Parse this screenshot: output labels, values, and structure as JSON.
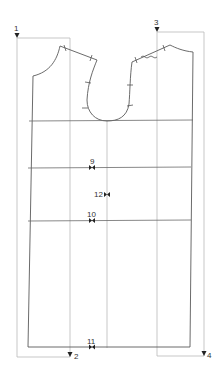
{
  "diagram": {
    "type": "sewing-pattern-bodice",
    "colors": {
      "background": "#ffffff",
      "guide": "#b9b9b9",
      "outline": "#5a5a5a",
      "marker": "#222222"
    },
    "point_labels": [
      {
        "id": "p1",
        "text": "1",
        "x": 17,
        "y": 30
      },
      {
        "id": "p2",
        "text": "2",
        "x": 71,
        "y": 357
      },
      {
        "id": "p3",
        "text": "3",
        "x": 156,
        "y": 24
      },
      {
        "id": "p4",
        "text": "4",
        "x": 205,
        "y": 357
      }
    ],
    "notch_labels": [
      {
        "id": "n9",
        "text": "9",
        "x": 92,
        "y": 134
      },
      {
        "id": "n12",
        "text": "12",
        "x": 100,
        "y": 196
      },
      {
        "id": "n10",
        "text": "10",
        "x": 92,
        "y": 217
      },
      {
        "id": "n11",
        "text": "11",
        "x": 92,
        "y": 346
      }
    ]
  }
}
